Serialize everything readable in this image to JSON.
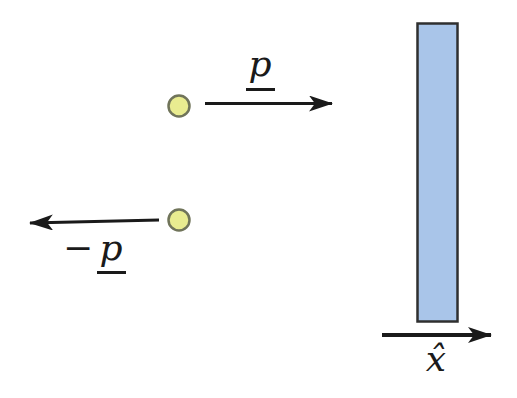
{
  "diagram": {
    "labels": {
      "momentum_right": "p",
      "momentum_left_sign": "−",
      "momentum_left_symbol": "p",
      "x_axis": "x̂"
    },
    "colors": {
      "background": "#ffffff",
      "ink": "#1a1a1a",
      "particle_fill": "#e9ec90",
      "particle_stroke": "#70745a",
      "wall_fill": "#a9c5e9",
      "wall_stroke": "#2f2f2f"
    }
  }
}
